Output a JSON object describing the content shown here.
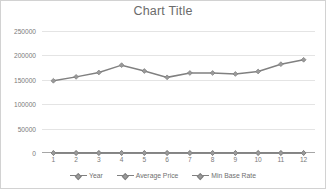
{
  "chart_data": {
    "type": "line",
    "title": "Chart Title",
    "xlabel": "",
    "ylabel": "",
    "categories": [
      "1",
      "2",
      "3",
      "4",
      "5",
      "6",
      "7",
      "8",
      "9",
      "10",
      "11",
      "12"
    ],
    "x": [
      1,
      2,
      3,
      4,
      5,
      6,
      7,
      8,
      9,
      10,
      11,
      12
    ],
    "ylim": [
      0,
      250000
    ],
    "yticks": [
      0,
      50000,
      100000,
      150000,
      200000,
      250000
    ],
    "ytick_labels": [
      "0",
      "50000",
      "100000",
      "150000",
      "200000",
      "250000"
    ],
    "grid": true,
    "legend_position": "bottom",
    "series": [
      {
        "name": "Year",
        "color": "#808080",
        "marker": "diamond",
        "values": [
          0,
          0,
          0,
          0,
          0,
          0,
          0,
          0,
          0,
          0,
          0,
          0
        ]
      },
      {
        "name": "Average Price",
        "color": "#808080",
        "marker": "diamond",
        "values": [
          148000,
          156000,
          165000,
          180000,
          168000,
          155000,
          164000,
          164000,
          162000,
          167000,
          182000,
          191000
        ]
      },
      {
        "name": "Min Base Rate",
        "color": "#808080",
        "marker": "diamond",
        "values": [
          0,
          0,
          0,
          0,
          0,
          0,
          0,
          0,
          0,
          0,
          0,
          0
        ]
      }
    ]
  },
  "colors": {
    "series_line": "#808080",
    "marker_fill": "#9a9a9a",
    "gridline": "#e4e4e4",
    "axis": "#a6a6a6",
    "tick_text": "#7a7a7a",
    "title_text": "#6b6b6b",
    "legend_text": "#6f6f6f",
    "frame_border": "#d2d2d2",
    "background": "#ffffff"
  }
}
